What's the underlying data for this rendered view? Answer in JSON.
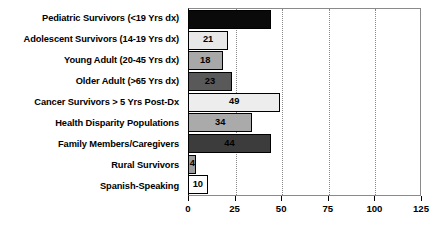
{
  "chart_data": {
    "type": "bar",
    "orientation": "horizontal",
    "title": "",
    "xlabel": "",
    "ylabel": "",
    "xlim": [
      0,
      125
    ],
    "xticks": [
      0,
      25,
      50,
      75,
      100,
      125
    ],
    "xtick_labels": [
      "0",
      "25",
      "50",
      "75",
      "100",
      "125"
    ],
    "grid": "vertical-dotted",
    "gridlines_at": [
      25,
      50,
      75,
      100
    ],
    "legend": "none",
    "categories": [
      "Pediatric Survivors (<19 Yrs dx)",
      "Adolescent Survivors (14-19 Yrs dx)",
      "Young Adult (20-45 Yrs dx)",
      "Older Adult (>65 Yrs dx)",
      "Cancer Survivors > 5 Yrs Post-Dx",
      "Health Disparity Populations",
      "Family Members/Caregivers",
      "Rural Survivors",
      "Spanish-Speaking"
    ],
    "values": [
      44,
      21,
      18,
      23,
      49,
      34,
      44,
      4,
      10
    ],
    "value_labels": [
      "",
      "21",
      "18",
      "23",
      "49",
      "34",
      "44",
      "4",
      "10"
    ],
    "bar_colors": [
      "#0a0a0a",
      "#e8e8e8",
      "#a8a8a8",
      "#595959",
      "#ededed",
      "#aaaaaa",
      "#3c3c3c",
      "#9c9c9c",
      "#fdfdfd"
    ],
    "bar_edge_color": "#000000",
    "bars": [
      {
        "category": "Pediatric Survivors (<19 Yrs dx)",
        "value": 44,
        "label": "",
        "color": "#0a0a0a"
      },
      {
        "category": "Adolescent Survivors (14-19 Yrs dx)",
        "value": 21,
        "label": "21",
        "color": "#e8e8e8"
      },
      {
        "category": "Young Adult (20-45 Yrs dx)",
        "value": 18,
        "label": "18",
        "color": "#a8a8a8"
      },
      {
        "category": "Older Adult (>65 Yrs dx)",
        "value": 23,
        "label": "23",
        "color": "#595959"
      },
      {
        "category": "Cancer Survivors > 5 Yrs Post-Dx",
        "value": 49,
        "label": "49",
        "color": "#ededed"
      },
      {
        "category": "Health Disparity Populations",
        "value": 34,
        "label": "34",
        "color": "#aaaaaa"
      },
      {
        "category": "Family Members/Caregivers",
        "value": 44,
        "label": "44",
        "color": "#3c3c3c"
      },
      {
        "category": "Rural Survivors",
        "value": 4,
        "label": "4",
        "color": "#9c9c9c"
      },
      {
        "category": "Spanish-Speaking",
        "value": 10,
        "label": "10",
        "color": "#fdfdfd"
      }
    ]
  }
}
